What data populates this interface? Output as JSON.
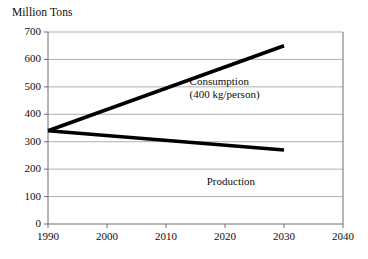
{
  "chart_data": {
    "type": "line",
    "title": "Million Tons",
    "xlabel": "",
    "ylabel": "Million Tons",
    "xlim": [
      1990,
      2040
    ],
    "ylim": [
      0,
      700
    ],
    "grid": true,
    "legend_position": "inline-annotation",
    "x_ticks": [
      "1990",
      "2000",
      "2010",
      "2020",
      "2030",
      "2040"
    ],
    "x_tick_values": [
      1990,
      2000,
      2010,
      2020,
      2030,
      2040
    ],
    "y_ticks": [
      "0",
      "100",
      "200",
      "300",
      "400",
      "500",
      "600",
      "700"
    ],
    "y_tick_values": [
      0,
      100,
      200,
      300,
      400,
      500,
      600,
      700
    ],
    "x": [
      1990,
      2030
    ],
    "series": [
      {
        "name": "Consumption",
        "annotation_line1": "Consumption",
        "annotation_line2": "(400 kg/person)",
        "color": "#000000",
        "x": [
          1990,
          2030
        ],
        "values": [
          340,
          650
        ]
      },
      {
        "name": "Production",
        "annotation_line1": "Production",
        "annotation_line2": "",
        "color": "#000000",
        "x": [
          1990,
          2030
        ],
        "values": [
          340,
          270
        ]
      }
    ],
    "annotations": [
      {
        "id": "consumption-label",
        "line1": "Consumption",
        "line2": "(400 kg/person)",
        "x": 2014,
        "y": 520
      },
      {
        "id": "production-label",
        "line1": "Production",
        "line2": "",
        "x": 2021,
        "y": 155
      }
    ],
    "colors": {
      "line": "#000000",
      "grid": "#9a9a9a",
      "axis": "#6e6e6e",
      "text": "#0d0d0d",
      "background": "#ffffff"
    }
  }
}
